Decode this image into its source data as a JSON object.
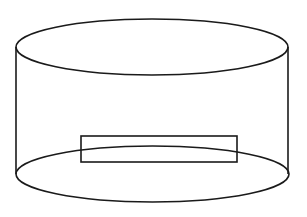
{
  "diagram": {
    "type": "cylinder-with-rectangle",
    "stroke_color": "#1a1a1a",
    "background": "#ffffff",
    "stroke_width": 1.6,
    "top_ellipse": {
      "cx": 152,
      "cy": 47,
      "rx": 136,
      "ry": 28
    },
    "bottom_ellipse": {
      "cx": 152.5,
      "cy": 174,
      "rx": 136.5,
      "ry": 28
    },
    "left_side": {
      "x": 16,
      "y1": 47,
      "y2": 174
    },
    "right_side": {
      "x": 288,
      "y1": 47,
      "y2": 174
    },
    "rectangle": {
      "x": 81,
      "y": 136,
      "width": 156,
      "height": 26
    }
  }
}
